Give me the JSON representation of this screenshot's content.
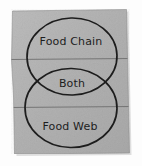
{
  "diagram": {
    "type": "venn",
    "kind": "two-set-venn-diagram",
    "medium": "hand-drawn-on-paper",
    "title_visible": false,
    "sets": [
      {
        "id": "top",
        "label": "Food Chain"
      },
      {
        "id": "bottom",
        "label": "Food Web"
      }
    ],
    "intersection": {
      "id": "both",
      "label": "Both"
    },
    "regions": [
      {
        "name": "top-only-region",
        "label": "Food Chain"
      },
      {
        "name": "intersection-region",
        "label": "Both"
      },
      {
        "name": "bottom-only-region",
        "label": "Food Web"
      }
    ],
    "rules": [
      {
        "name": "ruled-line-upper"
      },
      {
        "name": "ruled-line-lower"
      }
    ]
  },
  "colors": {
    "paper": "#b4b4b4",
    "paper_light": "#c2c2c2",
    "paper_shadow": "#9e9e9e",
    "ink": "#1d1d1d",
    "rule_line": "#6b6b6b",
    "page_background": "#fdfdfd"
  }
}
